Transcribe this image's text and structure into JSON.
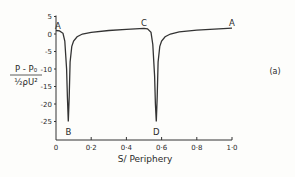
{
  "chart_data": {
    "type": "line",
    "title": "",
    "panel_label": "(a)",
    "xlabel": "S/ Periphery",
    "ylabel_numerator": "P - P₀",
    "ylabel_denominator": "½ρU²",
    "xlim": [
      0,
      1.0
    ],
    "ylim": [
      -27,
      5
    ],
    "grid": false,
    "x_ticks": [
      "0",
      "0·2",
      "0·4",
      "0·6",
      "0·8",
      "1·0"
    ],
    "x_tick_values": [
      0,
      0.2,
      0.4,
      0.6,
      0.8,
      1.0
    ],
    "y_ticks": [
      "5",
      "0",
      "-5",
      "-10",
      "-15",
      "-20",
      "-25"
    ],
    "y_tick_values": [
      5,
      0,
      -5,
      -10,
      -15,
      -20,
      -25
    ],
    "annotations": [
      {
        "text": "A",
        "x": 0.0,
        "y": 1.0
      },
      {
        "text": "B",
        "x": 0.07,
        "y": -26.5
      },
      {
        "text": "C",
        "x": 0.5,
        "y": 1.6
      },
      {
        "text": "D",
        "x": 0.57,
        "y": -26.5
      },
      {
        "text": "A",
        "x": 1.0,
        "y": 1.7
      }
    ],
    "series": [
      {
        "name": "pressure coefficient",
        "x": [
          0.0,
          0.02,
          0.04,
          0.05,
          0.06,
          0.065,
          0.07,
          0.075,
          0.08,
          0.09,
          0.1,
          0.12,
          0.15,
          0.2,
          0.3,
          0.4,
          0.5,
          0.52,
          0.54,
          0.55,
          0.56,
          0.565,
          0.57,
          0.575,
          0.58,
          0.59,
          0.6,
          0.62,
          0.65,
          0.7,
          0.8,
          0.9,
          1.0
        ],
        "y": [
          1.0,
          0.9,
          0.2,
          -2,
          -10,
          -18,
          -25,
          -18,
          -8,
          -3.5,
          -2,
          -0.8,
          0,
          0.5,
          1.0,
          1.3,
          1.6,
          1.5,
          0.5,
          -3,
          -12,
          -20,
          -25,
          -18,
          -8,
          -3.5,
          -2,
          -0.8,
          0,
          0.6,
          1.1,
          1.4,
          1.7
        ]
      }
    ]
  }
}
